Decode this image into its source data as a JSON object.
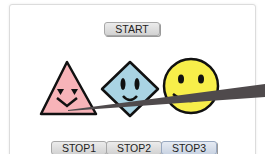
{
  "controls": {
    "start_label": "START",
    "stop_buttons": [
      {
        "label": "STOP1",
        "active": false
      },
      {
        "label": "STOP2",
        "active": false
      },
      {
        "label": "STOP3",
        "active": true
      }
    ]
  },
  "shapes": [
    {
      "name": "triangle-face",
      "color": "#f7b3b8"
    },
    {
      "name": "diamond-face",
      "color": "#a9d3e3"
    },
    {
      "name": "circle-face",
      "color": "#f7ee4a"
    }
  ],
  "beam": {
    "color": "#4f4a4c"
  }
}
